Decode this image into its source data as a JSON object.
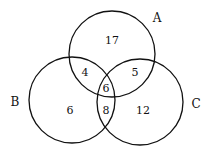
{
  "sets": [
    {
      "name": "A",
      "cx": 112,
      "cy": 54,
      "r": 43,
      "label_x": 157,
      "label_y": 22
    },
    {
      "name": "B",
      "cx": 72,
      "cy": 100,
      "r": 43,
      "label_x": 15,
      "label_y": 106
    },
    {
      "name": "C",
      "cx": 140,
      "cy": 102,
      "r": 43,
      "label_x": 196,
      "label_y": 108
    }
  ],
  "regions": [
    {
      "id": "A_only",
      "value": "17",
      "x": 112,
      "y": 44
    },
    {
      "id": "A_and_B_only",
      "value": "4",
      "x": 85,
      "y": 76
    },
    {
      "id": "A_and_C_only",
      "value": "5",
      "x": 135,
      "y": 76
    },
    {
      "id": "A_and_B_and_C",
      "value": "6",
      "x": 106,
      "y": 92
    },
    {
      "id": "B_and_C_only",
      "value": "8",
      "x": 106,
      "y": 114
    },
    {
      "id": "B_only",
      "value": "6",
      "x": 70,
      "y": 114
    },
    {
      "id": "C_only",
      "value": "12",
      "x": 143,
      "y": 114
    }
  ]
}
